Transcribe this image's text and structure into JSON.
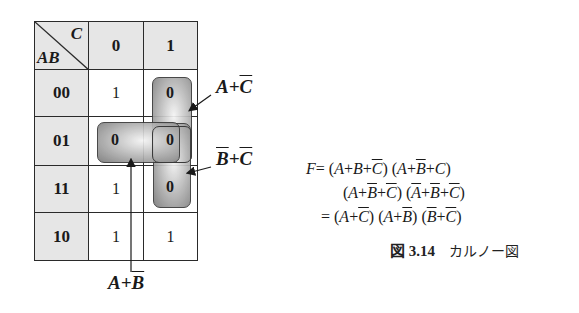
{
  "kmap": {
    "corner": {
      "col_var": "C",
      "row_var": "AB"
    },
    "col_headers": [
      "0",
      "1"
    ],
    "row_headers": [
      "00",
      "01",
      "11",
      "10"
    ],
    "cells": [
      [
        "1",
        "0"
      ],
      [
        "0",
        "0"
      ],
      [
        "1",
        "0"
      ],
      [
        "1",
        "1"
      ]
    ],
    "colors": {
      "header_fill": "#e6e6e6",
      "cell_fill": "#ffffff",
      "grid_line": "#2a2a2a",
      "loop_shade": "#7a7a7a"
    }
  },
  "groupings": [
    {
      "id": "a-plus-c-bar",
      "label_main": "A+",
      "label_overline": "C",
      "cells": "rows 00-01, col 1"
    },
    {
      "id": "b-bar-plus-c-bar",
      "label_overline_1": "B",
      "label_plus": "+",
      "label_overline_2": "C",
      "cells": "rows 01-11, col 1"
    },
    {
      "id": "a-plus-b-bar",
      "label_main": "A+",
      "label_overline": "B",
      "cells": "row 01, cols 0-1"
    }
  ],
  "equation": {
    "line1": "F = (A+B+C̄)(A+B̄+C)",
    "line2": "(A+B̄+C̄)(Ā+B̄+C̄)",
    "line3": "= (A+C̄)(A+B̄)(B̄+C̄)"
  },
  "caption": {
    "number": "図 3.14",
    "title": "カルノー図"
  }
}
